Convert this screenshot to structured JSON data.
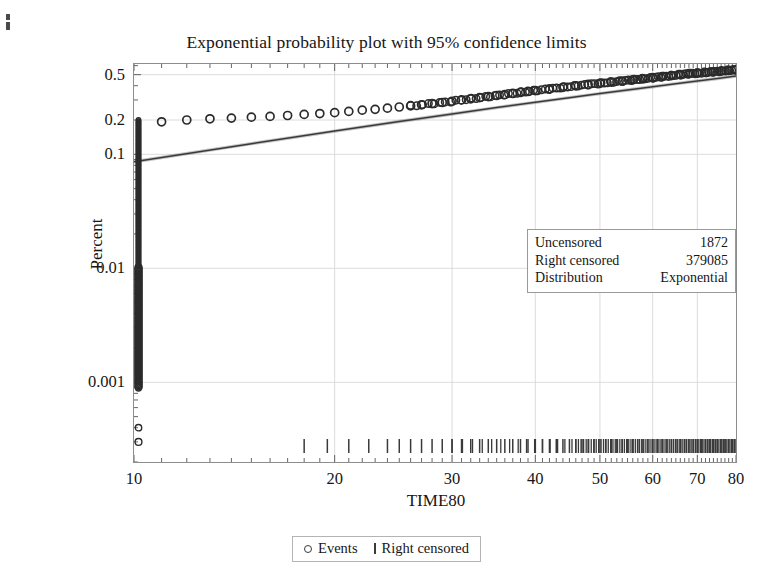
{
  "chart_data": {
    "type": "scatter",
    "title": "Exponential probability plot with 95% confidence limits",
    "xlabel": "TIME80",
    "ylabel": "Percent",
    "xscale": "log",
    "yscale": "log",
    "xlim": [
      10,
      80
    ],
    "ylim": [
      0.0002,
      0.62
    ],
    "grid": true,
    "xticks": [
      10,
      20,
      30,
      40,
      50,
      60,
      70,
      80
    ],
    "xtick_labels": [
      "10",
      "20",
      "30",
      "40",
      "50",
      "60",
      "70",
      "80"
    ],
    "yticks": [
      0.5,
      0.2,
      0.1,
      0.01,
      0.001
    ],
    "ytick_labels": [
      "0.5",
      "0.2",
      "0.1",
      "0.01",
      "0.001"
    ],
    "series": [
      {
        "name": "Events",
        "marker": "circle",
        "color": "#2b2b2b",
        "note": "Empirical percent points; dense vertical column of points at TIME80 = 10 spanning 0.0003 to 0.2, then a rising band of points from about 0.19 at TIME80 = 11 to 0.55 at TIME80 = 80",
        "x": [
          10,
          10,
          10,
          10,
          10,
          10,
          10,
          10,
          10,
          10,
          10,
          11,
          12,
          13,
          14,
          15,
          16,
          17,
          18,
          19,
          20,
          21,
          22,
          23,
          24,
          25,
          26,
          27,
          28,
          29,
          30,
          31,
          32,
          33,
          34,
          35,
          36,
          37,
          38,
          39,
          40,
          42,
          44,
          46,
          48,
          50,
          52,
          54,
          56,
          58,
          60,
          62,
          64,
          66,
          68,
          70,
          72,
          74,
          76,
          78,
          80
        ],
        "y": [
          0.0003,
          0.0009,
          0.0013,
          0.0018,
          0.0025,
          0.004,
          0.008,
          0.02,
          0.05,
          0.1,
          0.2,
          0.193,
          0.2,
          0.205,
          0.208,
          0.212,
          0.215,
          0.219,
          0.224,
          0.228,
          0.232,
          0.238,
          0.244,
          0.248,
          0.254,
          0.26,
          0.266,
          0.272,
          0.279,
          0.285,
          0.292,
          0.3,
          0.307,
          0.314,
          0.321,
          0.328,
          0.335,
          0.342,
          0.349,
          0.356,
          0.362,
          0.375,
          0.387,
          0.399,
          0.41,
          0.42,
          0.43,
          0.44,
          0.45,
          0.46,
          0.47,
          0.48,
          0.49,
          0.5,
          0.51,
          0.515,
          0.522,
          0.53,
          0.537,
          0.545,
          0.552
        ]
      },
      {
        "name": "Fitted exponential line with 95% confidence limits",
        "type": "line",
        "color": "#3a3a3a",
        "x": [
          10,
          15,
          20,
          25,
          30,
          35,
          40,
          45,
          50,
          55,
          60,
          65,
          70,
          75,
          80
        ],
        "y": [
          0.086,
          0.124,
          0.16,
          0.194,
          0.226,
          0.257,
          0.286,
          0.314,
          0.341,
          0.367,
          0.392,
          0.417,
          0.44,
          0.463,
          0.486
        ]
      },
      {
        "name": "Right censored",
        "marker": "vertical-tick",
        "color": "#3a3a3a",
        "note": "Censoring tick marks drawn along the bottom axis, increasing in density toward larger TIME80",
        "x": [
          18,
          19.5,
          21,
          22.5,
          24,
          25,
          26,
          27,
          28,
          29,
          30,
          31,
          32,
          33,
          34,
          35,
          36,
          37,
          38,
          39,
          40,
          41,
          42,
          43,
          44,
          45,
          46,
          47,
          48,
          49,
          50,
          51,
          52,
          53,
          54,
          55,
          56,
          57,
          58,
          59,
          60,
          61,
          62,
          63,
          64,
          65,
          66,
          67,
          68,
          69,
          70,
          71,
          72,
          73,
          74,
          75,
          76,
          77,
          78,
          79,
          80
        ]
      }
    ]
  },
  "info_box": {
    "rows": [
      {
        "label": "Uncensored",
        "value": "1872"
      },
      {
        "label": "Right censored",
        "value": "379085"
      },
      {
        "label": "Distribution",
        "value": "Exponential"
      }
    ]
  },
  "legend": {
    "entries": [
      {
        "label": "Events",
        "marker": "circle-marker-icon"
      },
      {
        "label": "Right censored",
        "marker": "tick-marker-icon"
      }
    ]
  }
}
